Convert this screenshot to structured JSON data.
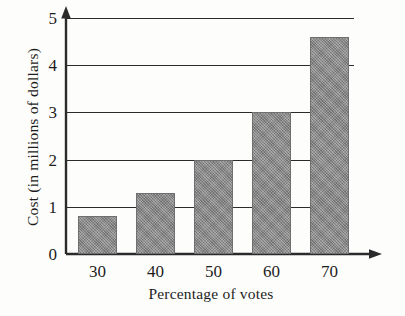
{
  "chart_data": {
    "type": "bar",
    "title": "",
    "subtitle": "",
    "xlabel": "Percentage of votes",
    "ylabel": "Cost (in millions of dollars)",
    "categories": [
      "30",
      "40",
      "50",
      "60",
      "70"
    ],
    "values": [
      0.8,
      1.3,
      2.0,
      3.0,
      4.6
    ],
    "series": [
      {
        "name": "Cost",
        "values": [
          0.8,
          1.3,
          2.0,
          3.0,
          4.6
        ]
      }
    ],
    "ylim": [
      0,
      5
    ],
    "y_ticks": [
      "0",
      "1",
      "2",
      "3",
      "4",
      "5"
    ],
    "y_tick_values": [
      0,
      1,
      2,
      3,
      4,
      5
    ],
    "grid": "horizontal",
    "legend": "none",
    "bar_color": "#8a8a8a",
    "axis_color": "#2b2b2b",
    "background_color": "#fdfdfc",
    "annotations": []
  },
  "axes": {
    "y_arrow": "up-arrow-icon",
    "x_arrow": "right-arrow-icon"
  }
}
